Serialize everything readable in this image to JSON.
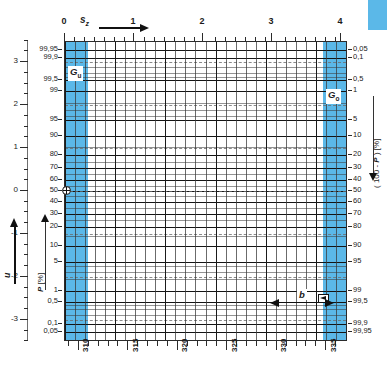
{
  "chart_data": {
    "type": "line",
    "title": "",
    "subtitle": "",
    "plot_kind": "normal-probability-paper",
    "xlabel": "s_z",
    "ylabel": "P [%]",
    "ylabel_right": "( 100 - P ) [%]",
    "ylabel_outer_left": "u",
    "top_axis": {
      "label": "s",
      "label_sub": "z",
      "ticks": [
        "0",
        "1",
        "2",
        "3",
        "4"
      ],
      "values": [
        0,
        1,
        2,
        3,
        4
      ],
      "minor_per_interval": 5,
      "range": [
        0,
        4.35
      ],
      "arrow": "right"
    },
    "bottom_axis": {
      "ticks": [
        "310",
        "315",
        "320",
        "325",
        "330",
        "335"
      ],
      "values": [
        310,
        315,
        320,
        325,
        330,
        335
      ],
      "minor_per_interval": 5,
      "range": [
        308.6,
        337.0
      ]
    },
    "left_axis_u": {
      "label": "u",
      "ticks": [
        "3",
        "2",
        "1",
        "0",
        "-1",
        "-2",
        "-3"
      ],
      "values": [
        3,
        2,
        1,
        0,
        -1,
        -2,
        -3
      ],
      "range": [
        -3.5,
        3.5
      ],
      "arrow": "up"
    },
    "left_axis_p": {
      "label": "P [%]",
      "ticks": [
        "99,95",
        "99,9",
        "99,5",
        "99",
        "95",
        "90",
        "80",
        "70",
        "60",
        "50",
        "40",
        "30",
        "20",
        "10",
        "5",
        "1",
        "0,5",
        "0,1",
        "0,05"
      ],
      "values": [
        99.95,
        99.9,
        99.5,
        99,
        95,
        90,
        80,
        70,
        60,
        50,
        40,
        30,
        20,
        10,
        5,
        1,
        0.5,
        0.1,
        0.05
      ],
      "arrow": "up"
    },
    "right_axis": {
      "label": "( 100 - P ) [%]",
      "ticks": [
        "0,05",
        "0,1",
        "0,5",
        "1",
        "5",
        "10",
        "20",
        "30",
        "40",
        "50",
        "60",
        "70",
        "80",
        "90",
        "95",
        "99",
        "99,5",
        "99,9",
        "99,95"
      ],
      "values": [
        0.05,
        0.1,
        0.5,
        1,
        5,
        10,
        20,
        30,
        40,
        50,
        60,
        70,
        80,
        90,
        95,
        99,
        99.5,
        99.9,
        99.95
      ],
      "arrow": "down"
    },
    "bands": [
      {
        "name": "G_u",
        "label": "G",
        "sub": "u",
        "x_range": [
          309.0,
          311.4
        ],
        "color": "#5bb8e8"
      },
      {
        "name": "G_o",
        "label": "G",
        "sub": "o",
        "x_range": [
          334.6,
          337.0
        ],
        "color": "#5bb8e8"
      }
    ],
    "annotations": [
      {
        "name": "b",
        "label": "b",
        "type": "dimension-arrow",
        "x_range": [
          331.5,
          334.6
        ],
        "y_percent": 1.0
      },
      {
        "name": "median-marker",
        "type": "crosshair-circle",
        "x": 309.2,
        "p_percent": 50
      },
      {
        "name": "right-marker",
        "type": "arrow-square",
        "x": 334.2,
        "p_percent": 1
      }
    ],
    "grid": true,
    "legend": "none"
  },
  "axes": {
    "top": {
      "name": "s-z-axis",
      "symbol": "s",
      "subscript": "z",
      "labels": [
        "0",
        "1",
        "2",
        "3",
        "4"
      ]
    },
    "bottom": {
      "name": "value-axis",
      "labels": [
        "310",
        "315",
        "320",
        "325",
        "330",
        "335"
      ]
    },
    "left_u": {
      "name": "u-axis",
      "symbol": "u",
      "labels": [
        "3",
        "2",
        "1",
        "0",
        "-1",
        "-2",
        "-3"
      ]
    },
    "left_p": {
      "name": "probability-axis",
      "symbol": "P",
      "unit": "[%]",
      "caption": "P [%]",
      "labels": [
        "99,95",
        "99,9",
        "99,5",
        "99",
        "95",
        "90",
        "80",
        "70",
        "60",
        "50",
        "40",
        "30",
        "20",
        "10",
        "5",
        "1",
        "0,5",
        "0,1",
        "0,05"
      ]
    },
    "right": {
      "name": "complement-probability-axis",
      "caption": "( 100 - P ) [%]",
      "caption_prefix": "( 100 - ",
      "caption_symbol": "P",
      "caption_suffix": " ) [%]",
      "labels": [
        "0,05",
        "0,1",
        "0,5",
        "1",
        "5",
        "10",
        "20",
        "30",
        "40",
        "50",
        "60",
        "70",
        "80",
        "90",
        "95",
        "99",
        "99,5",
        "99,9",
        "99,95"
      ]
    }
  },
  "callouts": {
    "lower_limit": {
      "symbol": "G",
      "sub": "u",
      "text": "Gu"
    },
    "upper_limit": {
      "symbol": "G",
      "sub": "o",
      "text": "Go"
    },
    "width": {
      "symbol": "b",
      "text": "b"
    }
  },
  "colors": {
    "band": "#5bb8e8",
    "chip": "#5bb8e8",
    "grid": "#3a3a3a",
    "grid_major": "#141414",
    "grid_dashed": "#6d6d6d",
    "text": "#1b1b1b",
    "background": "#ffffff"
  }
}
